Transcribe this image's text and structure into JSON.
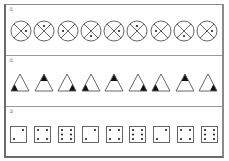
{
  "panels": [
    {
      "label": "①",
      "kind": "circle",
      "items": [
        "right",
        "top",
        "left",
        "bottom",
        "right",
        "top",
        "left",
        "bottom",
        "right"
      ]
    },
    {
      "label": "②",
      "kind": "triangle",
      "items": [
        "bottom-left",
        "top",
        "bottom-right",
        "bottom-left",
        "top",
        "bottom-right",
        "bottom-left",
        "top",
        "bottom-right"
      ]
    },
    {
      "label": "③",
      "kind": "die",
      "items": [
        2,
        4,
        6,
        2,
        4,
        6,
        2,
        4,
        6
      ]
    }
  ],
  "colors": {
    "stroke": "#555555",
    "fill": "#111111",
    "frame": "#6a6a6a"
  }
}
